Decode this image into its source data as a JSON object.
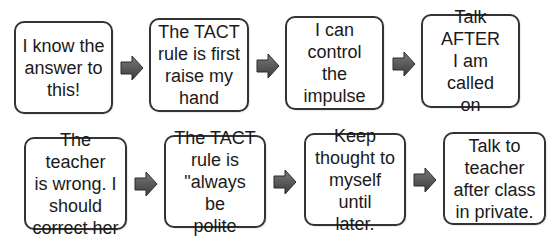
{
  "diagram": {
    "type": "flowchart",
    "rows": [
      {
        "name": "impulse-row",
        "steps": [
          {
            "id": "step-1",
            "text": "I know the\nanswer to\nthis!"
          },
          {
            "id": "step-2",
            "text": "The TACT\nrule is first\nraise my\nhand"
          },
          {
            "id": "step-3",
            "text": "I can\ncontrol the\nimpulse"
          },
          {
            "id": "step-4",
            "text": "Talk AFTER\nI am called\non"
          }
        ]
      },
      {
        "name": "correction-row",
        "steps": [
          {
            "id": "step-5",
            "text": "The teacher\nis wrong.  I\nshould\ncorrect her"
          },
          {
            "id": "step-6",
            "text": "The TACT\nrule is\n\"always be\npolite"
          },
          {
            "id": "step-7",
            "text": "Keep\nthought to\nmyself until\nlater."
          },
          {
            "id": "step-8",
            "text": "Talk to\nteacher\nafter class\nin private."
          }
        ]
      }
    ],
    "arrow_icon": "right-arrow-icon",
    "colors": {
      "box_border": "#333333",
      "box_fill": "#ffffff",
      "arrow_fill_light": "#7a7a7a",
      "arrow_fill_dark": "#3c3c3c",
      "arrow_stroke": "#2a2a2a",
      "text": "#1a1a1a"
    }
  }
}
